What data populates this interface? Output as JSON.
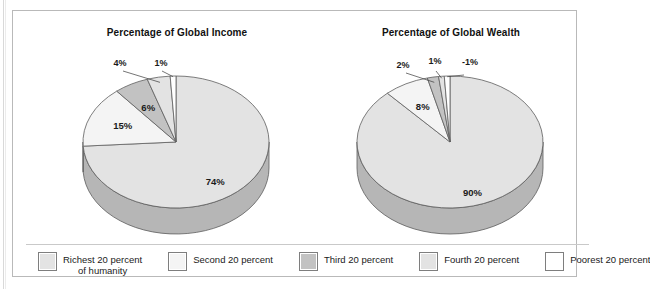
{
  "figure": {
    "charts": [
      {
        "id": "income",
        "title": "Percentage of Global Income",
        "labels": [
          "74%",
          "15%",
          "6%",
          "4%",
          "1%"
        ]
      },
      {
        "id": "wealth",
        "title": "Percentage of Global Wealth",
        "labels": [
          "90%",
          "8%",
          "2%",
          "1%",
          "-1%"
        ]
      }
    ],
    "legend": {
      "items": [
        {
          "label": "Richest 20 percent",
          "label_line2": "of humanity",
          "color": "#e3e3e3"
        },
        {
          "label": "Second 20 percent",
          "label_line2": "",
          "color": "#f4f4f4"
        },
        {
          "label": "Third 20 percent",
          "label_line2": "",
          "color": "#c2c2c2"
        },
        {
          "label": "Fourth 20 percent",
          "label_line2": "",
          "color": "#e3e3e3"
        },
        {
          "label": "Poorest 20 percent",
          "label_line2": "",
          "color": "#ffffff"
        }
      ]
    }
  },
  "chart_data": [
    {
      "type": "pie",
      "title": "Percentage of Global Income",
      "categories": [
        "Richest 20 percent of humanity",
        "Second 20 percent",
        "Third 20 percent",
        "Fourth 20 percent",
        "Poorest 20 percent"
      ],
      "values": [
        74,
        15,
        6,
        4,
        1
      ],
      "labels": [
        "74%",
        "15%",
        "6%",
        "4%",
        "1%"
      ],
      "unit": "percent",
      "colors": [
        "#e3e3e3",
        "#f4f4f4",
        "#c2c2c2",
        "#e3e3e3",
        "#ffffff"
      ],
      "legend_position": "bottom",
      "three_d": true,
      "start_angle_deg": 0,
      "direction": "clockwise"
    },
    {
      "type": "pie",
      "title": "Percentage of Global Wealth",
      "categories": [
        "Richest 20 percent of humanity",
        "Second 20 percent",
        "Third 20 percent",
        "Fourth 20 percent",
        "Poorest 20 percent"
      ],
      "values": [
        90,
        8,
        2,
        1,
        -1
      ],
      "labels": [
        "90%",
        "8%",
        "2%",
        "1%",
        "-1%"
      ],
      "unit": "percent",
      "colors": [
        "#e3e3e3",
        "#f4f4f4",
        "#c2c2c2",
        "#e3e3e3",
        "#ffffff"
      ],
      "legend_position": "bottom",
      "three_d": true,
      "start_angle_deg": 0,
      "direction": "clockwise"
    }
  ]
}
